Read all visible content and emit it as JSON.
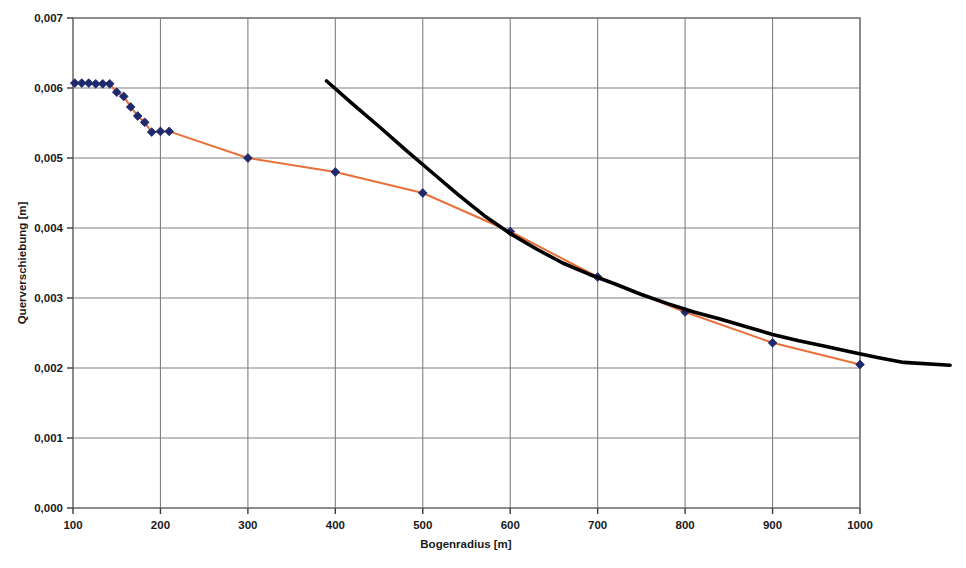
{
  "chart_data": {
    "type": "line",
    "title": "",
    "xlabel": "Bogenradius [m]",
    "ylabel": "Querverschiebung [m]",
    "xlim": [
      100,
      1000
    ],
    "ylim": [
      0.0,
      0.007
    ],
    "grid": true,
    "legend": "none",
    "x_ticks": [
      "100",
      "200",
      "300",
      "400",
      "500",
      "600",
      "700",
      "800",
      "900",
      "1000"
    ],
    "x_tick_values": [
      100,
      200,
      300,
      400,
      500,
      600,
      700,
      800,
      900,
      1000
    ],
    "y_ticks": [
      "0,000",
      "0,001",
      "0,002",
      "0,003",
      "0,004",
      "0,005",
      "0,006",
      "0,007"
    ],
    "y_tick_values": [
      0.0,
      0.001,
      0.002,
      0.003,
      0.004,
      0.005,
      0.006,
      0.007
    ],
    "decimal_separator": ",",
    "series": [
      {
        "name": "Messwerte",
        "type": "line-markers",
        "line_color": "#E8703A",
        "marker_color": "#1F2A6E",
        "marker": "diamond",
        "points": [
          [
            102,
            0.00607
          ],
          [
            110,
            0.00607
          ],
          [
            118,
            0.00607
          ],
          [
            126,
            0.00606
          ],
          [
            134,
            0.00606
          ],
          [
            142,
            0.00606
          ],
          [
            150,
            0.00594
          ],
          [
            158,
            0.00588
          ],
          [
            166,
            0.00573
          ],
          [
            174,
            0.0056
          ],
          [
            182,
            0.00551
          ],
          [
            190,
            0.00537
          ],
          [
            200,
            0.00538
          ],
          [
            210,
            0.00538
          ],
          [
            300,
            0.005
          ],
          [
            400,
            0.0048
          ],
          [
            500,
            0.0045
          ],
          [
            600,
            0.00395
          ],
          [
            700,
            0.0033
          ],
          [
            800,
            0.0028
          ],
          [
            900,
            0.00236
          ],
          [
            1000,
            0.00205
          ]
        ]
      },
      {
        "name": "Naeherungskurve",
        "type": "line",
        "line_color": "#000000",
        "marker": "none",
        "points": [
          [
            390,
            0.0061
          ],
          [
            420,
            0.00577
          ],
          [
            450,
            0.00545
          ],
          [
            480,
            0.00512
          ],
          [
            510,
            0.0048
          ],
          [
            540,
            0.00448
          ],
          [
            570,
            0.00418
          ],
          [
            600,
            0.00392
          ],
          [
            630,
            0.0037
          ],
          [
            660,
            0.0035
          ],
          [
            690,
            0.00334
          ],
          [
            720,
            0.0032
          ],
          [
            750,
            0.00305
          ],
          [
            780,
            0.00292
          ],
          [
            810,
            0.0028
          ],
          [
            840,
            0.0027
          ],
          [
            870,
            0.00259
          ],
          [
            900,
            0.00248
          ],
          [
            930,
            0.00239
          ],
          [
            960,
            0.00231
          ],
          [
            990,
            0.00223
          ],
          [
            1020,
            0.00215
          ],
          [
            1050,
            0.00208
          ],
          [
            1103,
            0.00204
          ]
        ]
      }
    ]
  },
  "axes": {
    "frame_color": "#808080",
    "grid_color": "#808080",
    "background": "#FFFFFF"
  }
}
